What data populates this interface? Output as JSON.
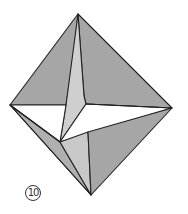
{
  "diagram": {
    "step_number": "10",
    "colors": {
      "face_dark": "#a6a6a6",
      "face_mid": "#b4b4b4",
      "face_light": "#cfcfcf",
      "face_white": "#ffffff",
      "edge": "#222222"
    },
    "vertices": {
      "top": [
        78,
        14
      ],
      "left": [
        10,
        105
      ],
      "right": [
        172,
        108
      ],
      "bottom": [
        91,
        195
      ],
      "center": [
        86,
        104
      ],
      "strip_bend": [
        84,
        96
      ],
      "inner_low": [
        60,
        142
      ],
      "lower_ridge": [
        88,
        132
      ]
    }
  }
}
